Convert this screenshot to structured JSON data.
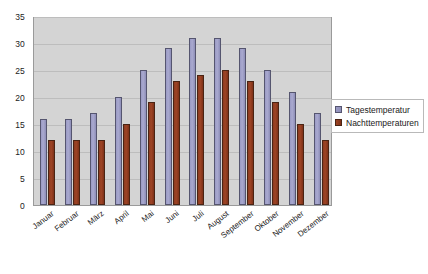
{
  "chart_data": {
    "type": "bar",
    "title": "",
    "xlabel": "",
    "ylabel": "",
    "ylim": [
      0,
      35
    ],
    "ytick_step": 5,
    "yticks": [
      "35",
      "30",
      "25",
      "20",
      "15",
      "10",
      "5",
      "0"
    ],
    "grid": true,
    "legend_position": "right",
    "categories": [
      "Januar",
      "Februar",
      "März",
      "April",
      "Mai",
      "Juni",
      "Juli",
      "August",
      "September",
      "Oktober",
      "November",
      "Dezember"
    ],
    "series": [
      {
        "name": "Tagestemperatur",
        "color": "#9a9ac4",
        "values": [
          16,
          16,
          17,
          20,
          25,
          29,
          31,
          31,
          29,
          25,
          21,
          17
        ]
      },
      {
        "name": "Nachttemperaturen",
        "color": "#9e4425",
        "values": [
          12,
          12,
          12,
          15,
          19,
          23,
          24,
          25,
          23,
          19,
          15,
          12
        ]
      }
    ]
  },
  "legend": {
    "items": [
      {
        "label": "Tagestemperatur",
        "swatch": "day"
      },
      {
        "label": "Nachttemperaturen",
        "swatch": "night"
      }
    ]
  },
  "colors": {
    "plot_background": "#d4d4d4",
    "gridline": "#bdbdbd",
    "plot_border": "#9a9a9a",
    "page_background": "#ffffff",
    "text": "#222222"
  }
}
